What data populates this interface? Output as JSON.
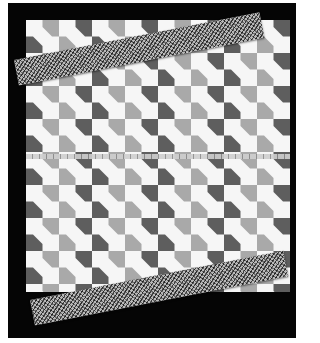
{
  "image": {
    "subject": "bow-tie patchwork quilt top on black background",
    "colors": {
      "background": "#050505",
      "light": "#f6f6f6",
      "mid": "#a9a9a9",
      "dark": "#5e5e5e"
    },
    "elements": [
      "quilt-top",
      "binding-strip-top",
      "binding-strip-bottom",
      "measuring-tape"
    ]
  }
}
